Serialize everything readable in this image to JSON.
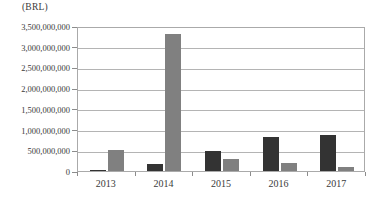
{
  "chart_data": {
    "type": "bar",
    "title": "",
    "unit_label": "(BRL)",
    "xlabel": "",
    "ylabel": "",
    "categories": [
      "2013",
      "2014",
      "2015",
      "2016",
      "2017"
    ],
    "series": [
      {
        "name": "series-a",
        "color": "#333333",
        "values": [
          25000000,
          160000000,
          480000000,
          820000000,
          870000000
        ]
      },
      {
        "name": "series-b",
        "color": "#808080",
        "values": [
          500000000,
          3300000000,
          290000000,
          200000000,
          90000000
        ]
      }
    ],
    "ylim": [
      0,
      3500000000
    ],
    "ytick_values": [
      0,
      500000000,
      1000000000,
      1500000000,
      2000000000,
      2500000000,
      3000000000,
      3500000000
    ],
    "ytick_labels": [
      "0",
      "500,000,000",
      "1,000,000,000",
      "1,500,000,000",
      "2,000,000,000",
      "2,500,000,000",
      "3,000,000,000",
      "3,500,000,000"
    ],
    "grid": true,
    "legend": false,
    "legend_position": "none"
  }
}
